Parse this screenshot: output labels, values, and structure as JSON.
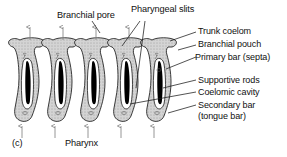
{
  "figure": {
    "panel_label": "(c)",
    "background_color": "#ffffff",
    "ink_color": "#101010",
    "tissue_fill": "#d4d4d4",
    "lumen_fill": "#ffffff",
    "rod_fill": "#000000"
  },
  "labels": {
    "branchial_pore": "Branchial pore",
    "pharyngeal_slits": "Pharyngeal slits",
    "trunk_coelom": "Trunk coelom",
    "branchial_pouch": "Branchial pouch",
    "primary_bar": "Primary bar (septa)",
    "supportive_rods": "Supportive rods",
    "coelomic_cavity": "Coelomic cavity",
    "secondary_bar_line1": "Secondary bar",
    "secondary_bar_line2": "(tongue bar)",
    "pharynx": "Pharynx"
  },
  "structure": {
    "repeating_units": 4,
    "pouch_count": 5,
    "outflow_arrows": 4,
    "inflow_arrows": 5,
    "internal_flow_arrows": 8,
    "epithelium_texture": "ciliated-dotted"
  }
}
